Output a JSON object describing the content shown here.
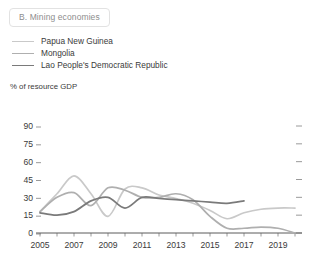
{
  "panel": {
    "title": "B. Mining economies"
  },
  "legend": {
    "position": "top-left",
    "items": [
      {
        "label": "Papua New Guinea",
        "color": "#c9c9c9",
        "icon": "line-swatch-icon"
      },
      {
        "label": "Mongolia",
        "color": "#afafaf",
        "icon": "line-swatch-icon"
      },
      {
        "label": "Lao People's Democratic Republic",
        "color": "#7a7a7a",
        "icon": "line-swatch-icon"
      }
    ]
  },
  "axes": {
    "y_unit_label": "% of resource GDP",
    "y_ticks": [
      "90",
      "75",
      "60",
      "45",
      "30",
      "15",
      "0"
    ],
    "x_ticks": [
      "2005",
      "2007",
      "2009",
      "2011",
      "2013",
      "2015",
      "2017",
      "2019"
    ]
  },
  "chart_data": {
    "type": "line",
    "title": "B. Mining economies",
    "xlabel": "",
    "ylabel": "% of resource GDP",
    "ylim": [
      0,
      90
    ],
    "xlim": [
      2005,
      2020
    ],
    "ytick_values": [
      0,
      15,
      30,
      45,
      60,
      75,
      90
    ],
    "xtick_values": [
      2005,
      2007,
      2009,
      2011,
      2013,
      2015,
      2017,
      2019
    ],
    "grid": false,
    "legend_position": "top-left",
    "x": [
      2005,
      2006,
      2007,
      2008,
      2009,
      2010,
      2011,
      2012,
      2013,
      2014,
      2015,
      2016,
      2017,
      2018,
      2019,
      2020
    ],
    "series": [
      {
        "name": "Papua New Guinea",
        "color": "#c9c9c9",
        "values": [
          18,
          33,
          48,
          33,
          14,
          37,
          38,
          32,
          29,
          25,
          19,
          12,
          17,
          20,
          21,
          21
        ]
      },
      {
        "name": "Mongolia",
        "color": "#afafaf",
        "values": [
          18,
          30,
          34,
          23,
          38,
          36,
          30,
          30,
          33,
          28,
          14,
          4,
          4,
          5,
          4,
          0
        ]
      },
      {
        "name": "Lao People's Democratic Republic",
        "color": "#7a7a7a",
        "values": [
          17,
          15,
          18,
          27,
          30,
          21,
          30,
          29,
          28,
          27,
          26,
          25,
          27,
          null,
          null,
          null
        ]
      }
    ]
  }
}
